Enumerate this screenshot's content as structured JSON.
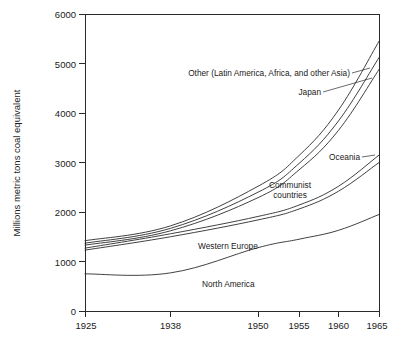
{
  "chart_data": {
    "type": "line",
    "title": "",
    "subtitle": "",
    "xlabel": "",
    "ylabel": "Millions metric tons coal equivalent",
    "x": [
      1925,
      1938,
      1950,
      1955,
      1960,
      1965
    ],
    "xlim": [
      1925,
      1965
    ],
    "ylim": [
      0,
      6000
    ],
    "grid": false,
    "legend_position": "inline-annotations",
    "xticks": [
      1925,
      1938,
      1950,
      1955,
      1960,
      1965
    ],
    "xticklabels": [
      "1925",
      "1938",
      "1950",
      "1955",
      "1960",
      "1965"
    ],
    "yticks": [
      0,
      1000,
      2000,
      3000,
      4000,
      5000,
      6000
    ],
    "yticklabels": [
      "0",
      "1000",
      "2000",
      "3000",
      "4000",
      "5000",
      "6000"
    ],
    "stacked": true,
    "note": "Cumulative stacked curves; each line is a running total of regions beneath it",
    "series": [
      {
        "name": "North America",
        "label": "North America",
        "values": [
          750,
          770,
          1280,
          1450,
          1630,
          1950
        ]
      },
      {
        "name": "Western Europe",
        "label": "Western Europe",
        "values": [
          1230,
          1500,
          1840,
          2060,
          2420,
          3000
        ]
      },
      {
        "name": "Oceania",
        "label": "Oceania",
        "values": [
          1270,
          1560,
          1910,
          2140,
          2520,
          3150
        ]
      },
      {
        "name": "Communist countries",
        "label": "Communist countries",
        "values": [
          1330,
          1620,
          2290,
          2850,
          3650,
          4880
        ]
      },
      {
        "name": "Japan",
        "label": "Japan",
        "values": [
          1370,
          1670,
          2400,
          2980,
          3840,
          5120
        ]
      },
      {
        "name": "Other (Latin America, Africa, and other Asia)",
        "label": "Other (Latin America, Africa, and other Asia)",
        "values": [
          1420,
          1720,
          2520,
          3140,
          4060,
          5450
        ]
      }
    ],
    "annotations": [
      {
        "text": "Other (Latin America, Africa, and other Asia)",
        "anchor_year": 1963,
        "anchor_value": 4650
      },
      {
        "text": "Japan",
        "anchor_year": 1964,
        "anchor_value": 4380
      },
      {
        "text": "Oceania",
        "anchor_year": 1963,
        "anchor_value": 3130
      },
      {
        "text": "Communist countries",
        "anchor_year": 1954,
        "anchor_value": 2480
      },
      {
        "text": "Western Europe",
        "anchor_year": 1947,
        "anchor_value": 1560
      },
      {
        "text": "North America",
        "anchor_year": 1949,
        "anchor_value": 880
      }
    ]
  }
}
